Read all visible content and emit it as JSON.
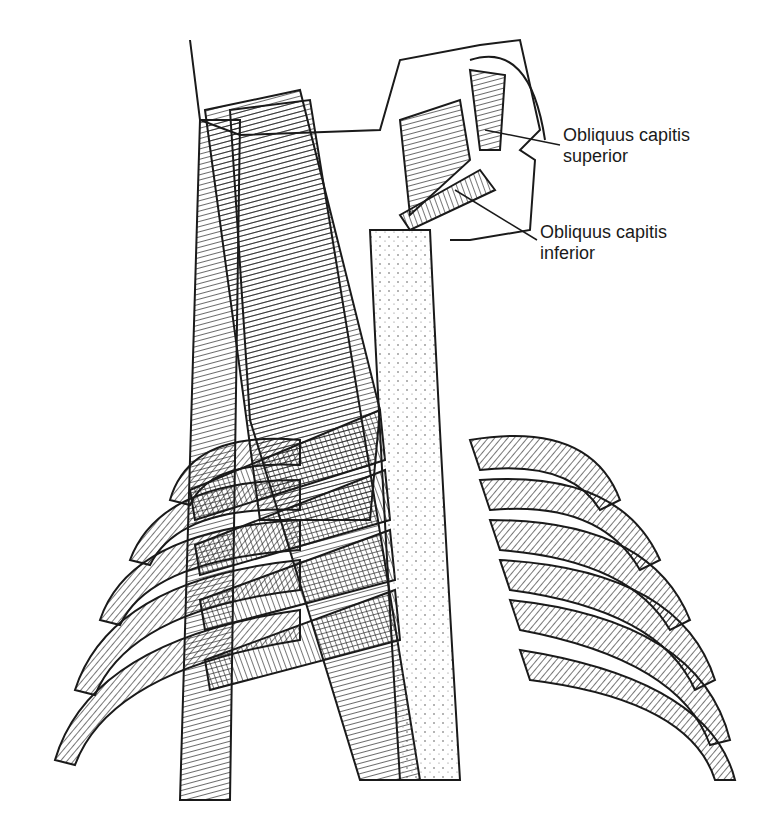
{
  "figure": {
    "labels": [
      {
        "id": "obliquus-superior",
        "line1": "Obliquus capitis",
        "line2": "superior"
      },
      {
        "id": "obliquus-inferior",
        "line1": "Obliquus capitis",
        "line2": "inferior"
      }
    ]
  },
  "colors": {
    "ink": "#1a1a1a",
    "paper": "#ffffff",
    "bone": "#f2f2f2"
  }
}
